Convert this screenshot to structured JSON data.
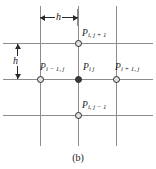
{
  "figure": {
    "caption": "(b)",
    "type": "finite-difference-grid-stencil",
    "colors": {
      "grid_line": "#8c8c8c",
      "node_outline": "#2a2a2a",
      "node_fill_center": "#3a3a3a",
      "node_fill_open": "#e2e2e2",
      "label_text": "#1a1a1a",
      "background": "#ffffff",
      "dimension_arrow": "#2a2a2a"
    }
  },
  "dimensions": {
    "horizontal": {
      "label": "h",
      "orientation": "horizontal",
      "description": "horizontal grid spacing between adjacent vertical grid lines"
    },
    "vertical": {
      "label": "h",
      "orientation": "vertical",
      "description": "vertical grid spacing between adjacent horizontal grid lines"
    }
  },
  "nodes": [
    {
      "id": "p-i-j-plus-1",
      "base": "P",
      "subscript": "i, j + 1",
      "style": "open",
      "label_position": "above-right"
    },
    {
      "id": "p-i-minus-1-j",
      "base": "P",
      "subscript": "i − 1, j",
      "style": "open",
      "label_position": "above-right"
    },
    {
      "id": "p-i-j",
      "base": "P",
      "subscript": "i j",
      "style": "filled",
      "label_position": "above-right"
    },
    {
      "id": "p-i-plus-1-j",
      "base": "P",
      "subscript": "i + 1, j",
      "style": "open",
      "label_position": "above-right"
    },
    {
      "id": "p-i-j-minus-1",
      "base": "P",
      "subscript": "i, j − 1",
      "style": "open",
      "label_position": "above-right"
    }
  ],
  "grid": {
    "horizontal_lines": 3,
    "vertical_lines": 3
  }
}
